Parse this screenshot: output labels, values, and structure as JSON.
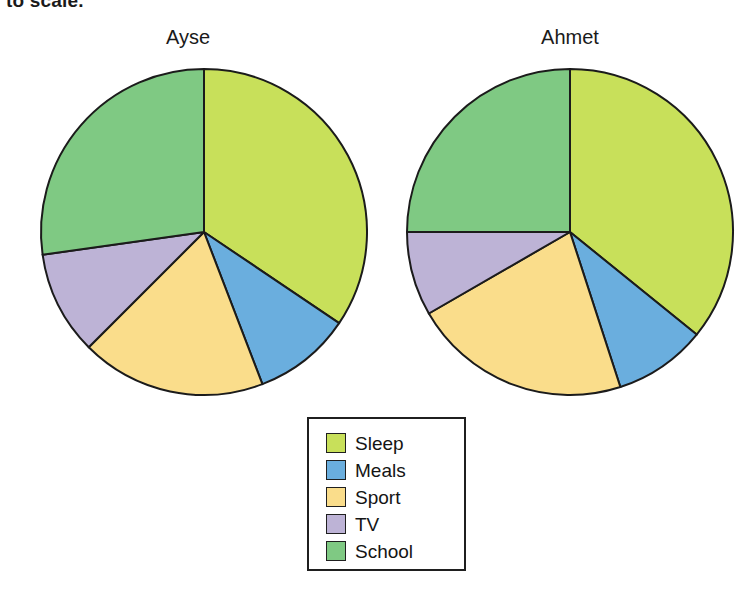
{
  "page": {
    "cut_off_text": "to scale."
  },
  "charts": [
    {
      "title": "Ayse",
      "cx": 184,
      "cy": 168,
      "r": 163
    },
    {
      "title": "Ahmet",
      "cx": 168,
      "cy": 168,
      "r": 163
    }
  ],
  "legend": {
    "items": [
      {
        "label": "Sleep",
        "color": "#c8e05a"
      },
      {
        "label": "Meals",
        "color": "#6aaede"
      },
      {
        "label": "Sport",
        "color": "#fadd8b"
      },
      {
        "label": "TV",
        "color": "#bdb3d6"
      },
      {
        "label": "School",
        "color": "#7fc983"
      }
    ]
  },
  "chart_data": [
    {
      "type": "pie",
      "title": "Ayse",
      "categories": [
        "Sleep",
        "Meals",
        "Sport",
        "TV",
        "School"
      ],
      "colors": [
        "#c8e05a",
        "#6aaede",
        "#fadd8b",
        "#bdb3d6",
        "#7fc983"
      ],
      "values": [
        124,
        35,
        66,
        37,
        98
      ],
      "unit": "degrees",
      "start_angle": 0,
      "direction": "clockwise",
      "percentages": [
        34.4,
        9.7,
        18.3,
        10.3,
        27.2
      ],
      "legend_position": "bottom-center"
    },
    {
      "type": "pie",
      "title": "Ahmet",
      "categories": [
        "Sleep",
        "Meals",
        "Sport",
        "TV",
        "School"
      ],
      "colors": [
        "#c8e05a",
        "#6aaede",
        "#fadd8b",
        "#bdb3d6",
        "#7fc983"
      ],
      "values": [
        129,
        33,
        78,
        30,
        90
      ],
      "unit": "degrees",
      "start_angle": 0,
      "direction": "clockwise",
      "percentages": [
        35.8,
        9.2,
        21.7,
        8.3,
        25.0
      ],
      "legend_position": "bottom-center"
    }
  ]
}
